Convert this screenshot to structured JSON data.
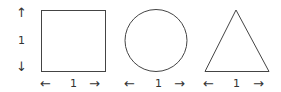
{
  "diagram": {
    "shapes": [
      {
        "type": "square",
        "width_label": "1",
        "height_label": "1"
      },
      {
        "type": "circle",
        "width_label": "1"
      },
      {
        "type": "triangle",
        "width_label": "1"
      }
    ],
    "arrows": {
      "left": "←",
      "right": "→",
      "up": "↑",
      "down": "↓"
    },
    "stroke_color": "#444444"
  }
}
